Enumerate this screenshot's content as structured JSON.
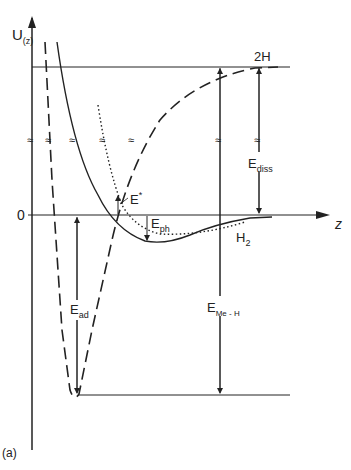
{
  "figure": {
    "panel_label": "(a)",
    "y_axis_label": "U",
    "y_axis_subscript": "(z)",
    "x_axis_label": "z",
    "zero_label": "0",
    "curve_labels": {
      "two_h": "2H",
      "h2": "H",
      "h2_sub": "2"
    },
    "energy_labels": {
      "e_star": "E",
      "e_star_sup": "*",
      "e_ph": "E",
      "e_ph_sub": "ph",
      "e_diss": "E",
      "e_diss_sub": "diss",
      "e_ad": "E",
      "e_ad_sub": "ad",
      "e_meh": "E",
      "e_meh_sub": "Me - H"
    },
    "colors": {
      "ink": "#222222",
      "background": "#ffffff"
    }
  }
}
